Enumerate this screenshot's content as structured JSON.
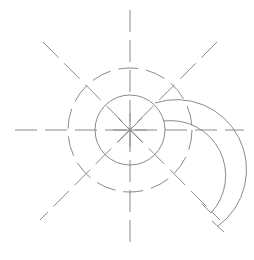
{
  "diagram": {
    "type": "technical-drawing",
    "stroke_color": "#8a8a8a",
    "background": "#ffffff",
    "center": [
      130,
      130
    ],
    "centerlines": {
      "dash": "22 8",
      "horizontal": [
        15,
        130,
        244,
        130
      ],
      "vertical": [
        130,
        10,
        130,
        250
      ],
      "diagonal_a": [
        43,
        42,
        220,
        220
      ],
      "diagonal_b": [
        217,
        42,
        40,
        220
      ]
    },
    "inner_circle": {
      "r": 35,
      "style": "solid"
    },
    "outer_circle": {
      "r": 62,
      "style": "dashed",
      "dash": "20 8"
    },
    "center_star": {
      "arm": 17
    },
    "arcs": [
      {
        "name": "outer-arc",
        "d": "M 155 103 A 70 70 0 0 1 218 226"
      },
      {
        "name": "inner-arc",
        "d": "M 164 121 A 55 55 0 0 1 211 213"
      }
    ],
    "arc_end_ticks": [
      {
        "name": "inner-arc-end-tick",
        "x1": 202,
        "y1": 204,
        "x2": 211,
        "y2": 213
      },
      {
        "name": "outer-arc-end-tick",
        "x1": 212,
        "y1": 221,
        "x2": 224,
        "y2": 232
      }
    ]
  }
}
